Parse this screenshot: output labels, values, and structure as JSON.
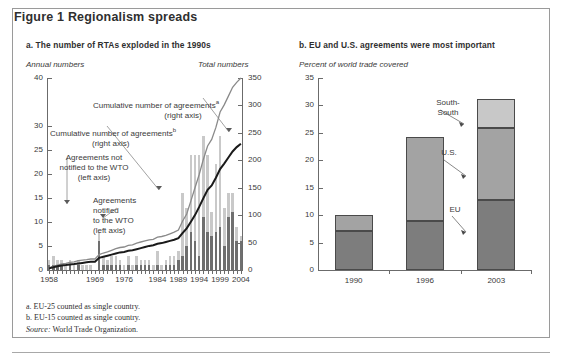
{
  "figure": {
    "title": "Figure 1  Regionalism spreads"
  },
  "panel_a": {
    "title": "a. The number of RTAs exploded in the 1990s",
    "left_unit": "Annual numbers",
    "right_unit": "Total numbers",
    "annotations": {
      "cumulative_a_line1": "Cumulative number of agreements",
      "cumulative_a_sup": "a",
      "cumulative_a_line2": "(right axis)",
      "cumulative_b_line1": "Cumulative number of agreements",
      "cumulative_b_sup": "b",
      "cumulative_b_line2": "(right axis)",
      "not_notified_line1": "Agreements not",
      "not_notified_line2": "notified to the WTO",
      "not_notified_line3": "(left axis)",
      "notified_line1": "Agreements",
      "notified_line2": "notified",
      "notified_line3": "to the WTO",
      "notified_line4": "(left axis)"
    }
  },
  "panel_b": {
    "title": "b. EU and U.S. agreements were most important",
    "unit": "Percent of world trade covered",
    "labels": {
      "south_south_line1": "South-",
      "south_south_line2": "South",
      "us": "U.S.",
      "eu": "EU"
    }
  },
  "footnotes": {
    "a": "a. EU-25 counted as single country.",
    "b": "b. EU-15 counted as single country.",
    "source_label": "Source:",
    "source_text": " World Trade Organization."
  },
  "colors": {
    "notified_bar": "#6f6f6f",
    "not_notified_bar": "#c9c9c9",
    "cumulative_a_line": "#8a8a8a",
    "cumulative_b_line": "#1a1a1a",
    "eu_segment": "#7d7d7d",
    "us_segment": "#a3a3a3",
    "south_south_segment": "#c8c8c8",
    "axis": "#6b6b6b"
  },
  "chart_data": [
    {
      "type": "bar",
      "id": "panel-a",
      "title": "a. The number of RTAs exploded in the 1990s",
      "xlabel": "",
      "ylabel": "Annual numbers",
      "y2label": "Total numbers",
      "ylim": [
        0,
        40
      ],
      "y2lim": [
        0,
        350
      ],
      "yticks": [
        0,
        5,
        10,
        15,
        20,
        25,
        30,
        40
      ],
      "y2ticks": [
        0,
        50,
        100,
        150,
        200,
        250,
        300,
        350
      ],
      "grid": false,
      "legend": "annotations",
      "xticklabels": [
        "1958",
        "1969",
        "1976",
        "1984",
        "1989",
        "1994",
        "1999",
        "2004"
      ],
      "xtickyears": [
        1958,
        1969,
        1976,
        1984,
        1989,
        1994,
        1999,
        2004
      ],
      "x": [
        1958,
        1959,
        1960,
        1961,
        1962,
        1963,
        1964,
        1965,
        1966,
        1967,
        1968,
        1969,
        1970,
        1971,
        1972,
        1973,
        1974,
        1975,
        1976,
        1977,
        1978,
        1979,
        1980,
        1981,
        1982,
        1983,
        1984,
        1985,
        1986,
        1987,
        1988,
        1989,
        1990,
        1991,
        1992,
        1993,
        1994,
        1995,
        1996,
        1997,
        1998,
        1999,
        2000,
        2001,
        2002,
        2003,
        2004
      ],
      "series": [
        {
          "name": "Agreements notified to the WTO (left axis)",
          "axis": "left",
          "stack": "bars",
          "values": [
            1,
            1,
            1,
            1,
            0,
            1,
            0,
            1,
            0,
            0,
            0,
            0,
            6,
            1,
            1,
            1,
            1,
            1,
            0,
            1,
            0,
            1,
            1,
            1,
            1,
            0,
            1,
            0,
            1,
            1,
            1,
            2,
            3,
            5,
            8,
            6,
            3,
            11,
            8,
            7,
            8,
            9,
            5,
            11,
            12,
            6,
            6
          ]
        },
        {
          "name": "Agreements not notified to the WTO (left axis)",
          "axis": "left",
          "stack": "bars",
          "values": [
            1,
            2,
            1,
            1,
            1,
            1,
            1,
            1,
            1,
            1,
            1,
            0,
            2,
            2,
            1,
            2,
            2,
            1,
            1,
            2,
            1,
            2,
            1,
            1,
            1,
            1,
            3,
            1,
            1,
            2,
            2,
            2,
            13,
            8,
            16,
            18,
            21,
            17,
            16,
            5,
            14,
            19,
            8,
            5,
            4,
            3,
            1
          ]
        },
        {
          "name": "Cumulative number of agreements (a) (right axis)",
          "axis": "right",
          "type": "line",
          "color": "#8a8a8a",
          "values": [
            4,
            7,
            9,
            11,
            12,
            14,
            15,
            17,
            18,
            19,
            20,
            20,
            28,
            31,
            33,
            36,
            39,
            41,
            42,
            45,
            46,
            49,
            51,
            53,
            55,
            56,
            60,
            61,
            63,
            66,
            69,
            73,
            89,
            102,
            126,
            150,
            174,
            202,
            226,
            238,
            260,
            288,
            301,
            317,
            333,
            342,
            350
          ]
        },
        {
          "name": "Cumulative number of agreements (b) (right axis)",
          "axis": "right",
          "type": "line",
          "color": "#1a1a1a",
          "values": [
            3,
            5,
            7,
            8,
            9,
            10,
            11,
            12,
            13,
            14,
            15,
            15,
            22,
            24,
            26,
            28,
            30,
            32,
            33,
            35,
            36,
            38,
            40,
            42,
            44,
            45,
            48,
            49,
            51,
            53,
            55,
            58,
            67,
            76,
            88,
            100,
            115,
            131,
            146,
            154,
            168,
            184,
            194,
            205,
            216,
            224,
            230
          ]
        }
      ]
    },
    {
      "type": "bar",
      "id": "panel-b",
      "subtype": "stacked",
      "title": "b. EU and U.S. agreements were most important",
      "ylabel": "Percent of world trade covered",
      "ylim": [
        0,
        35
      ],
      "yticks": [
        0,
        5,
        10,
        15,
        20,
        25,
        30,
        35
      ],
      "grid": false,
      "categories": [
        "1990",
        "1996",
        "2003"
      ],
      "series": [
        {
          "name": "EU",
          "values": [
            7.2,
            9.0,
            12.8
          ]
        },
        {
          "name": "U.S.",
          "values": [
            2.8,
            15.3,
            13.0
          ]
        },
        {
          "name": "South-South",
          "values": [
            0.0,
            0.0,
            5.4
          ]
        }
      ],
      "totals": [
        10.0,
        24.3,
        31.2
      ]
    }
  ]
}
